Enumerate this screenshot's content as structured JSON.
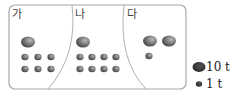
{
  "regions": [
    {
      "label": "가",
      "large_count": 1,
      "small_count": 6
    },
    {
      "label": "나",
      "large_count": 1,
      "small_count": 8
    },
    {
      "label": "다",
      "large_count": 2,
      "small_count": 1
    }
  ],
  "legend": {
    "large": {
      "label": "10 t"
    },
    "small": {
      "label": "1 t"
    }
  },
  "colors": {
    "border": "#9a9a9a",
    "pebble_dark": "#555555",
    "pebble_light": "#9a9a9a"
  }
}
